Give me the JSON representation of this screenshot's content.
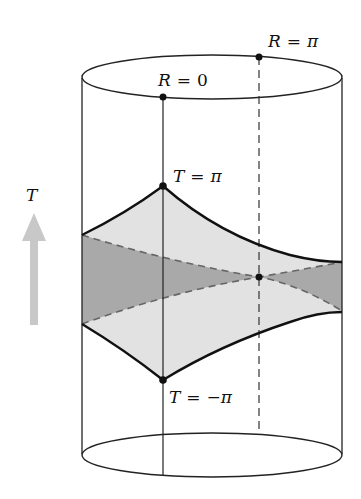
{
  "diagram": {
    "type": "anti-de-sitter-cylinder",
    "axis_label": "T",
    "labels": {
      "r_pi": "R = π",
      "r_zero": "R = 0",
      "t_pi": "T = π",
      "t_neg_pi": "T = −π"
    },
    "label_parts": {
      "r_pi": {
        "var": "R",
        "eq": "=",
        "val": "π"
      },
      "r_zero": {
        "var": "R",
        "eq": "=",
        "val": "0"
      },
      "t_pi": {
        "var": "T",
        "eq": "=",
        "val": "π"
      },
      "t_neg_pi": {
        "var": "T",
        "eq": "=",
        "val": "−π"
      }
    },
    "colors": {
      "line": "#111111",
      "light_fill": "#e2e2e2",
      "dark_fill": "#a9a9a9",
      "dashed": "#666666",
      "arrow": "#c8c8c8",
      "background": "#ffffff"
    },
    "points": [
      {
        "name": "R=pi top",
        "x": 259,
        "y": 57
      },
      {
        "name": "R=0 top",
        "x": 163,
        "y": 97
      },
      {
        "name": "T=pi",
        "x": 163,
        "y": 186
      },
      {
        "name": "T=-pi",
        "x": 163,
        "y": 380
      },
      {
        "name": "intersection",
        "x": 259,
        "y": 277
      }
    ]
  }
}
